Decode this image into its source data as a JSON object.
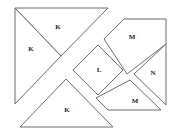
{
  "figure": {
    "type": "tangram-dissection-diagram",
    "width": 180,
    "height": 134,
    "background_color": "#ffffff",
    "stroke_color": "#6b6b6b",
    "fill_color": "#ffffff",
    "label_color": "#1a1a1a"
  },
  "pieces": [
    {
      "id": "piece-k-top",
      "label": "K",
      "shape": "right-triangle",
      "points": "15,8 108,8 61,56",
      "label_x": 58,
      "label_y": 27
    },
    {
      "id": "piece-k-left",
      "label": "K",
      "shape": "right-triangle",
      "points": "15,8 61,56 15,104",
      "label_x": 31,
      "label_y": 49
    },
    {
      "id": "piece-k-bottom",
      "label": "K",
      "shape": "right-triangle",
      "points": "20,127 113,127 66,79",
      "label_x": 67,
      "label_y": 110
    },
    {
      "id": "piece-l-square",
      "label": "L",
      "shape": "square-diamond",
      "points": "73,70 98,45 123,70 98,95",
      "label_x": 99,
      "label_y": 70
    },
    {
      "id": "piece-m-top",
      "label": "M",
      "shape": "pentagon-trapezoid",
      "points": "104,39 124,19 166,19 166,44 127,74",
      "label_x": 132,
      "label_y": 37
    },
    {
      "id": "piece-n",
      "label": "N",
      "shape": "right-triangle",
      "points": "166,44 166,105 134,74",
      "label_x": 153,
      "label_y": 73
    },
    {
      "id": "piece-m-bottom",
      "label": "M",
      "shape": "pentagon-trapezoid",
      "points": "130,80 161,110 121,110 108,110 96,98",
      "label_x": 135,
      "label_y": 101
    }
  ],
  "outline_segments": [
    "15,8 108,8",
    "15,8 15,104",
    "20,127 113,127"
  ],
  "labels_legend": [
    "K",
    "K",
    "K",
    "L",
    "M",
    "N",
    "M"
  ]
}
